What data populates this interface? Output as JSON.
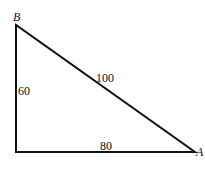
{
  "diagram": {
    "type": "right-triangle",
    "vertices": {
      "top": {
        "label": "B"
      },
      "right": {
        "label": "A"
      }
    },
    "sides": {
      "vertical": {
        "label": "60"
      },
      "hypotenuse": {
        "label": "100"
      },
      "horizontal": {
        "label": "80"
      }
    },
    "line_color": "#111111"
  }
}
